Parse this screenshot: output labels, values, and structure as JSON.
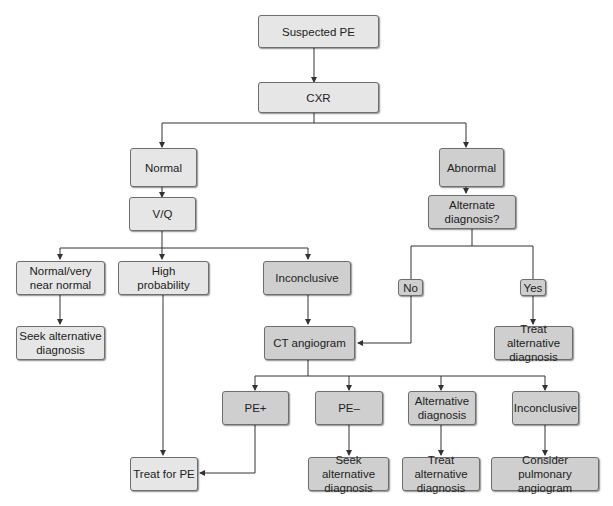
{
  "colors": {
    "light_box": "#e6e6e6",
    "dark_box": "#cfcfcf",
    "border": "#6e6e6e",
    "line": "#333333"
  },
  "nodes": {
    "suspected_pe": "Suspected PE",
    "cxr": "CXR",
    "normal": "Normal",
    "abnormal": "Abnormal",
    "vq": "V/Q",
    "alternate_diagnosis_q": "Alternate\ndiagnosis?",
    "vq_normal": "Normal/very\nnear normal",
    "vq_high": "High\nprobability",
    "vq_inconclusive": "Inconclusive",
    "no": "No",
    "yes": "Yes",
    "seek_alt_1": "Seek alternative\ndiagnosis",
    "ct_angiogram": "CT angiogram",
    "treat_alt_1": "Treat alternative\ndiagnosis",
    "pe_pos": "PE+",
    "pe_neg": "PE–",
    "ct_alt_diag": "Alternative\ndiagnosis",
    "ct_inconclusive": "Inconclusive",
    "treat_pe": "Treat for PE",
    "seek_alt_2": "Seek alternative\ndiagnosis",
    "treat_alt_2": "Treat alternative\ndiagnosis",
    "consider_angio": "Consider pulmonary\nangiogram"
  }
}
